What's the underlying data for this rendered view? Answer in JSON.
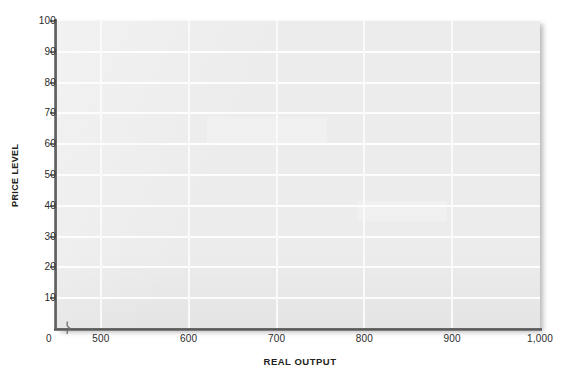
{
  "chart_data": {
    "type": "line",
    "title": "",
    "subtitle": "",
    "xlabel": "REAL OUTPUT",
    "ylabel": "PRICE LEVEL",
    "xlim": [
      450,
      1000
    ],
    "ylim": [
      0,
      100
    ],
    "x_axis_break": true,
    "x_origin_label": "0",
    "xticks": [
      {
        "value": 500,
        "label": "500"
      },
      {
        "value": 600,
        "label": "600"
      },
      {
        "value": 700,
        "label": "700"
      },
      {
        "value": 800,
        "label": "800"
      },
      {
        "value": 900,
        "label": "900"
      },
      {
        "value": 1000,
        "label": "1,000"
      }
    ],
    "yticks": [
      {
        "value": 10,
        "label": "10"
      },
      {
        "value": 20,
        "label": "20"
      },
      {
        "value": 30,
        "label": "30"
      },
      {
        "value": 40,
        "label": "40"
      },
      {
        "value": 50,
        "label": "50"
      },
      {
        "value": 60,
        "label": "60"
      },
      {
        "value": 70,
        "label": "70"
      },
      {
        "value": 80,
        "label": "80"
      },
      {
        "value": 90,
        "label": "90"
      },
      {
        "value": 100,
        "label": "100"
      }
    ],
    "series": [],
    "annotations": [],
    "grid": true,
    "legend": false,
    "legend_position": "none",
    "plot_background": "#ececec",
    "gridline_color": "#ffffff",
    "axis_color": "#5d5d5d",
    "page_background": "#ffffff",
    "text_color": "#231f20"
  }
}
